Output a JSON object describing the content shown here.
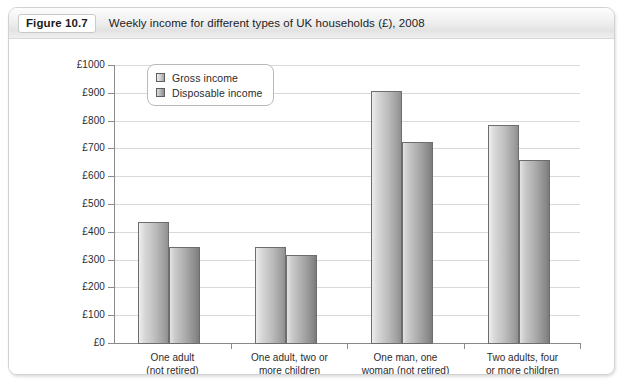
{
  "figure": {
    "number": "Figure 10.7",
    "caption": "Weekly income for different types of UK households (£), 2008"
  },
  "chart_data": {
    "type": "bar",
    "title": "Weekly income for different types of UK households (£), 2008",
    "xlabel": "",
    "ylabel": "",
    "ylim": [
      0,
      1000
    ],
    "ytick_labels": [
      "£1000",
      "£900",
      "£800",
      "£700",
      "£600",
      "£500",
      "£400",
      "£300",
      "£200",
      "£100",
      "£0"
    ],
    "ytick_values": [
      1000,
      900,
      800,
      700,
      600,
      500,
      400,
      300,
      200,
      100,
      0
    ],
    "grid": true,
    "legend_position": "top-left-inside",
    "categories": [
      [
        "One adult",
        "(not retired)"
      ],
      [
        "One adult, two or",
        "more children"
      ],
      [
        "One man, one",
        "woman (not retired)"
      ],
      [
        "Two adults, four",
        "or more children"
      ]
    ],
    "series": [
      {
        "name": "Gross income",
        "values": [
          435,
          345,
          908,
          785
        ]
      },
      {
        "name": "Disposable income",
        "values": [
          347,
          317,
          722,
          660
        ]
      }
    ]
  },
  "colors": {
    "gridline": "#d9d9d9",
    "axis": "#8a8a8a",
    "bar_gross": "#bdbdbd",
    "bar_disposable": "#a9a9a9",
    "card_border": "#d2d2d2",
    "header_bg": "#eeeeee"
  }
}
